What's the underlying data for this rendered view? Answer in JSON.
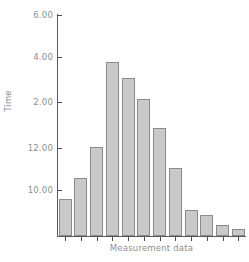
{
  "chart_data": {
    "type": "bar",
    "title": "",
    "xlabel": "Measurement data",
    "ylabel": "Time",
    "grid": false,
    "legend": "none",
    "categories": [
      "1",
      "2",
      "3",
      "4",
      "5",
      "6",
      "7",
      "8",
      "9",
      "10",
      "11",
      "12"
    ],
    "values": [
      0.82,
      1.29,
      1.98,
      3.87,
      3.51,
      3.04,
      2.4,
      1.51,
      0.58,
      0.47,
      0.24,
      0.16
    ],
    "bar_pixel_heights": [
      37,
      58,
      89,
      174,
      158,
      137,
      108,
      68,
      26,
      21,
      11,
      7
    ],
    "ytick_labels": [
      "6.00",
      "4.00",
      "2.00",
      "12.00",
      "10.00"
    ],
    "ytick_pixel_y": [
      15,
      57,
      102,
      148,
      190
    ],
    "axis_baseline_pixel_y": 236,
    "n_bars": 12,
    "colors": {
      "bar_fill": "#c9c9c9",
      "bar_border": "#8a8a8a",
      "axis": "#5a5a5a",
      "tick_label": "#8e8e8e",
      "background": "#ffffff"
    }
  }
}
